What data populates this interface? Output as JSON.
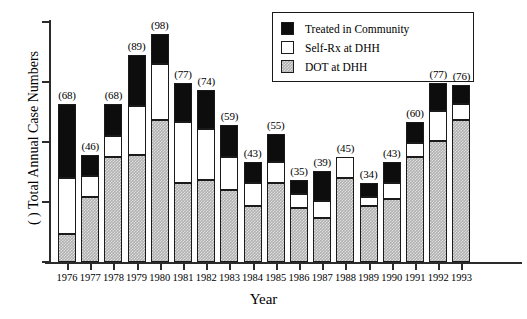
{
  "chart_data": {
    "type": "bar",
    "title": "",
    "xlabel": "Year",
    "ylabel": "( ) Total Annual Case Numbers",
    "stacked": true,
    "grid": false,
    "legend_position": "top-right",
    "ylim": [
      0,
      103
    ],
    "y_tick_labels": [
      "",
      "",
      "",
      "",
      ""
    ],
    "categories": [
      "1976",
      "1977",
      "1978",
      "1979",
      "1980",
      "1981",
      "1982",
      "1983",
      "1984",
      "1985",
      "1986",
      "1987",
      "1988",
      "1989",
      "1990",
      "1991",
      "1992",
      "1993"
    ],
    "totals": [
      68,
      46,
      68,
      89,
      98,
      77,
      74,
      59,
      43,
      55,
      35,
      39,
      45,
      34,
      43,
      60,
      77,
      76
    ],
    "total_labels": [
      "(68)",
      "(46)",
      "(68)",
      "(89)",
      "(98)",
      "(77)",
      "(74)",
      "(59)",
      "(43)",
      "(55)",
      "(35)",
      "(39)",
      "(45)",
      "(34)",
      "(43)",
      "(60)",
      "(77)",
      "(76)"
    ],
    "series": [
      {
        "name": "DOT at DHH",
        "color": "#b0b0b0",
        "values": [
          12,
          28,
          45,
          46,
          61,
          34,
          35,
          31,
          24,
          34,
          23,
          19,
          36,
          24,
          27,
          45,
          52,
          61
        ]
      },
      {
        "name": "Self-Rx at DHH",
        "color": "#ffffff",
        "values": [
          24,
          9,
          9,
          21,
          24,
          26,
          22,
          14,
          10,
          9,
          6,
          7,
          9,
          4,
          7,
          6,
          13,
          7
        ]
      },
      {
        "name": "Treated in Community",
        "color": "#0d0d0d",
        "values": [
          32,
          9,
          14,
          22,
          13,
          17,
          17,
          14,
          9,
          12,
          6,
          13,
          0,
          6,
          9,
          9,
          12,
          8
        ]
      }
    ]
  },
  "legend": {
    "items": [
      {
        "label": "Treated in Community",
        "swatch": "community"
      },
      {
        "label": "Self-Rx at DHH",
        "swatch": "selfrx"
      },
      {
        "label": "DOT at DHH",
        "swatch": "dot"
      }
    ]
  }
}
